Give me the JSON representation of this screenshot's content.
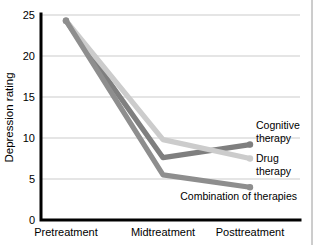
{
  "figure": {
    "clipped_title": "Depression rating by type of therapy",
    "background_color": "#ffffff"
  },
  "chart_data": {
    "type": "line",
    "title": "",
    "xlabel": "",
    "ylabel": "Depression rating",
    "categories": [
      "Pretreatment",
      "Midtreatment",
      "Posttreatment"
    ],
    "ylim": [
      0,
      25
    ],
    "yticks": [
      0,
      5,
      10,
      15,
      20,
      25
    ],
    "ytick_labels": [
      "0",
      "5",
      "10",
      "15",
      "20",
      "25"
    ],
    "grid": true,
    "grid_axis": "y",
    "legend": "inline-right-labels",
    "series": [
      {
        "name": "Cognitive therapy",
        "label_lines": [
          "Cognitive",
          "therapy"
        ],
        "color": "#7f7f7f",
        "values": [
          24.3,
          7.6,
          9.2
        ]
      },
      {
        "name": "Drug therapy",
        "label_lines": [
          "Drug",
          "therapy"
        ],
        "color": "#cccccc",
        "values": [
          24.3,
          9.8,
          7.5
        ]
      },
      {
        "name": "Combination of therapies",
        "label_lines": [
          "Combination of therapies"
        ],
        "color": "#8e8e8e",
        "values": [
          24.3,
          5.5,
          4.0
        ]
      }
    ]
  },
  "axis": {
    "color": "#000000",
    "gridline_color": "#b5b5b5",
    "right_border_color": "#9a9a9a"
  }
}
